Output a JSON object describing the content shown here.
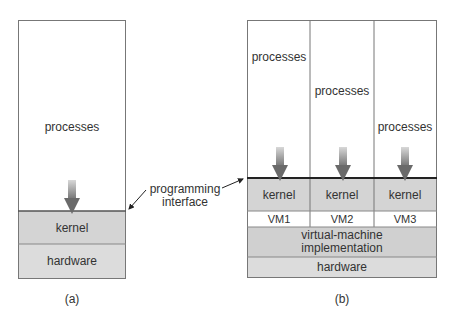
{
  "diagram_a": {
    "processes": "processes",
    "kernel": "kernel",
    "hardware": "hardware",
    "caption": "(a)"
  },
  "annotation": {
    "programming_interface_line1": "programming",
    "programming_interface_line2": "interface"
  },
  "diagram_b": {
    "vms": [
      {
        "processes": "processes",
        "kernel": "kernel",
        "label": "VM1"
      },
      {
        "processes": "processes",
        "kernel": "kernel",
        "label": "VM2"
      },
      {
        "processes": "processes",
        "kernel": "kernel",
        "label": "VM3"
      }
    ],
    "vm_impl_line1": "virtual-machine",
    "vm_impl_line2": "implementation",
    "hardware": "hardware",
    "caption": "(b)"
  }
}
